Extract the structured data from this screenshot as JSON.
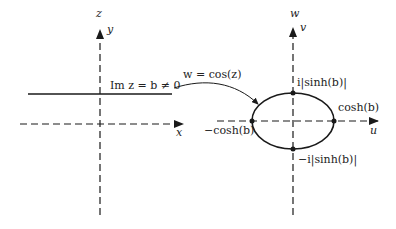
{
  "figure": {
    "left_plane": {
      "plane_label": "z",
      "vertical_axis_label": "y",
      "horizontal_axis_label": "x",
      "line_label": "Im z = b ≠ 0"
    },
    "mapping": {
      "label": "w = cos(z)"
    },
    "right_plane": {
      "plane_label": "w",
      "vertical_axis_label": "v",
      "horizontal_axis_label": "u",
      "points": {
        "top": "i|sinh(b)|",
        "bottom": "−i|sinh(b)|",
        "right": "cosh(b)",
        "left": "−cosh(b)"
      }
    },
    "colors": {
      "ink": "#1a1a1a",
      "background": "#ffffff"
    }
  }
}
